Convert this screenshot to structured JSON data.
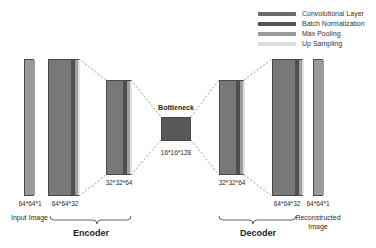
{
  "figure": {
    "type": "neural-network-architecture-diagram",
    "title_visible": false,
    "background_color": "#ffffff"
  },
  "legend": {
    "position": "top-right",
    "items": [
      {
        "label": "Convolutional Layer",
        "color": "#6b6b6b",
        "swatch_name": "legend-swatch-conv"
      },
      {
        "label": "Batch Normalization",
        "color": "#545454",
        "swatch_name": "legend-swatch-bn"
      },
      {
        "label": "Max Pooling",
        "color": "#9a9a9a",
        "swatch_name": "legend-swatch-pool"
      },
      {
        "label": "Up Sampling",
        "color": "#dcdcdc",
        "swatch_name": "legend-swatch-upsample"
      }
    ]
  },
  "blocks": [
    {
      "id": "input-image",
      "dim_label": "64*64*1",
      "caption": "Input Image",
      "stripes": [
        {
          "role": "Convolutional Layer",
          "color": "#9a9a9a",
          "width": 10
        }
      ]
    },
    {
      "id": "encoder-block-1",
      "dim_label": "64*64*32",
      "stripes": [
        {
          "role": "Convolutional Layer",
          "color": "#787878",
          "width": 22
        },
        {
          "role": "Batch Normalization",
          "color": "#4f4f4f",
          "width": 4
        },
        {
          "role": "Max Pooling",
          "color": "#9e9e9e",
          "width": 3
        },
        {
          "role": "Up Sampling",
          "color": "#e2e2e2",
          "width": 2
        }
      ]
    },
    {
      "id": "encoder-block-2",
      "dim_label": "32*32*64",
      "stripes": [
        {
          "role": "Convolutional Layer",
          "color": "#787878",
          "width": 16
        },
        {
          "role": "Batch Normalization",
          "color": "#4f4f4f",
          "width": 4
        },
        {
          "role": "Max Pooling",
          "color": "#9e9e9e",
          "width": 3
        },
        {
          "role": "Up Sampling",
          "color": "#e2e2e2",
          "width": 2
        }
      ]
    },
    {
      "id": "bottleneck",
      "title": "Bottleneck",
      "dim_label": "16*16*128",
      "color": "#595959"
    },
    {
      "id": "decoder-block-1",
      "dim_label": "32*32*64",
      "stripes": [
        {
          "role": "Convolutional Layer",
          "color": "#787878",
          "width": 16
        },
        {
          "role": "Batch Normalization",
          "color": "#4f4f4f",
          "width": 4
        },
        {
          "role": "Max Pooling",
          "color": "#9e9e9e",
          "width": 3
        },
        {
          "role": "Up Sampling",
          "color": "#e2e2e2",
          "width": 2
        }
      ]
    },
    {
      "id": "decoder-block-2",
      "dim_label": "64*64*32",
      "stripes": [
        {
          "role": "Convolutional Layer",
          "color": "#787878",
          "width": 22
        },
        {
          "role": "Batch Normalization",
          "color": "#4f4f4f",
          "width": 4
        },
        {
          "role": "Max Pooling",
          "color": "#9e9e9e",
          "width": 3
        },
        {
          "role": "Up Sampling",
          "color": "#e2e2e2",
          "width": 2
        }
      ]
    },
    {
      "id": "reconstructed-image",
      "dim_label": "64*64*1",
      "caption_line1": "Reconstructed",
      "caption_line2": "Image",
      "stripes": [
        {
          "role": "Convolutional Layer",
          "color": "#9a9a9a",
          "width": 10
        }
      ]
    }
  ],
  "sections": [
    {
      "id": "encoder",
      "label": "Encoder"
    },
    {
      "id": "decoder",
      "label": "Decoder"
    }
  ],
  "connectors": {
    "style": "dashed",
    "color": "#6e6e6e",
    "description": "perspective lines linking successive block corners"
  }
}
